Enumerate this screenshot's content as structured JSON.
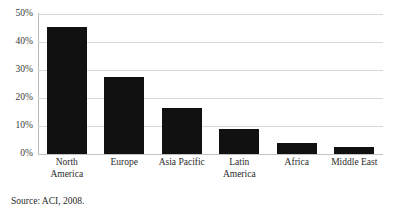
{
  "figure": {
    "clipped_title": "",
    "source_note": "Source: ACI, 2008."
  },
  "chart_data": {
    "type": "bar",
    "title": "",
    "xlabel": "",
    "ylabel": "",
    "categories": [
      "North America",
      "Europe",
      "Asia Pacific",
      "Latin America",
      "Africa",
      "Middle East"
    ],
    "category_lines": [
      [
        "North",
        "America"
      ],
      [
        "Europe"
      ],
      [
        "Asia Pacific"
      ],
      [
        "Latin",
        "America"
      ],
      [
        "Africa"
      ],
      [
        "Middle East"
      ]
    ],
    "values": [
      45.5,
      27.5,
      16.5,
      9,
      4,
      2.5
    ],
    "value_unit": "%",
    "ylim": [
      0,
      50
    ],
    "yticks": [
      0,
      10,
      20,
      30,
      40,
      50
    ],
    "ytick_labels": [
      "0%",
      "10%",
      "20%",
      "30%",
      "40%",
      "50%"
    ],
    "grid": true,
    "legend": "none",
    "bar_color": "#111111",
    "gridline_color": "#d9d9d9"
  }
}
